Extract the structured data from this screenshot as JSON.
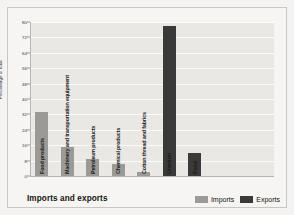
{
  "figure": {
    "title": "Imports and exports",
    "background": "#f4f3f1",
    "plot_background": "#e9e8e5"
  },
  "legend": {
    "position": "bottom-right",
    "entries": [
      {
        "label": "Imports",
        "color": "#9b9a97"
      },
      {
        "label": "Exports",
        "color": "#3a3a3a"
      }
    ]
  },
  "chart_data": {
    "type": "bar",
    "title": "Imports and exports",
    "xlabel": "",
    "ylabel": "Percentage of total",
    "ylim": [
      0,
      80
    ],
    "yticks": [
      0,
      8,
      16,
      24,
      32,
      40,
      48,
      56,
      64,
      72,
      80
    ],
    "grid": true,
    "categories": [
      "Food products",
      "Machinery and transportation equipment",
      "Petroleum products",
      "Chemical products",
      "Cotton thread and fabrics",
      "Uranium",
      "Food"
    ],
    "series": [
      {
        "name": "Imports",
        "color": "#9b9a97",
        "values": [
          33,
          15,
          9,
          6,
          2,
          null,
          null
        ]
      },
      {
        "name": "Exports",
        "color": "#3a3a3a",
        "values": [
          null,
          null,
          null,
          null,
          null,
          78,
          12
        ]
      }
    ],
    "bars": [
      {
        "label": "Food products",
        "value": 33,
        "series": "Imports"
      },
      {
        "label": "Machinery and transportation equipment",
        "value": 15,
        "series": "Imports"
      },
      {
        "label": "Petroleum products",
        "value": 9,
        "series": "Imports"
      },
      {
        "label": "Chemical products",
        "value": 6,
        "series": "Imports"
      },
      {
        "label": "Cotton thread and fabrics",
        "value": 2,
        "series": "Imports"
      },
      {
        "label": "Uranium",
        "value": 78,
        "series": "Exports"
      },
      {
        "label": "Food",
        "value": 12,
        "series": "Exports"
      }
    ]
  }
}
